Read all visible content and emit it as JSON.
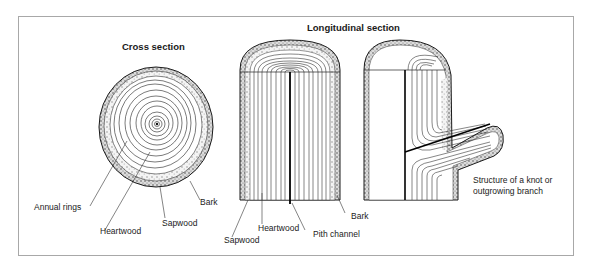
{
  "diagram": {
    "sections": {
      "cross": {
        "title": "Cross section",
        "labels": {
          "annual_rings": "Annual rings",
          "heartwood": "Heartwood",
          "sapwood": "Sapwood",
          "bark": "Bark"
        }
      },
      "longitudinal": {
        "title": "Longitudinal section",
        "labels": {
          "sapwood": "Sapwood",
          "heartwood": "Heartwood",
          "pith_channel": "Pith channel",
          "bark": "Bark"
        }
      },
      "knot": {
        "caption_line1": "Structure of a knot or",
        "caption_line2": "outgrowing branch"
      }
    },
    "colors": {
      "line": "#1a1a1a",
      "frame": "#a8a8a8",
      "bark_fill": "#d9d9d9",
      "sapwood_fill": "#eeeeee",
      "background": "#ffffff"
    }
  }
}
